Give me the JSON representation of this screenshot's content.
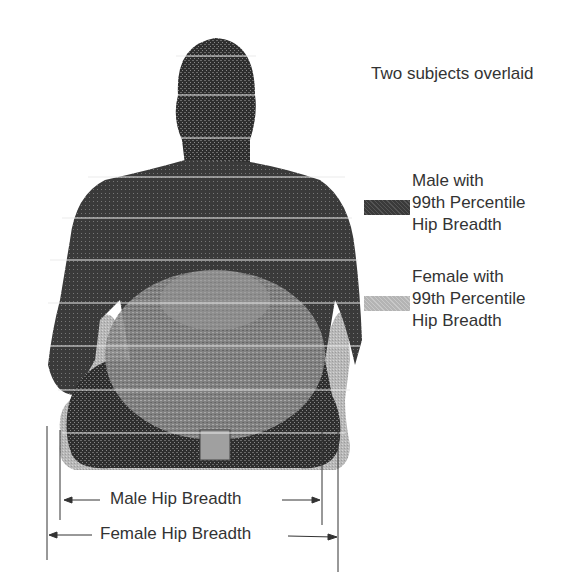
{
  "figure": {
    "title": "Two subjects overlaid",
    "legend": [
      {
        "line1": "Male with",
        "line2": "99th Percentile",
        "line3": "Hip Breadth",
        "swatch_color": "#3a3a3a"
      },
      {
        "line1": "Female with",
        "line2": "99th Percentile",
        "line3": "Hip Breadth",
        "swatch_color": "#b4b4b4"
      }
    ],
    "dimensions": {
      "male_label": "Male Hip Breadth",
      "female_label": "Female Hip Breadth"
    },
    "colors": {
      "male_body": "#2e2e2e",
      "female_body": "#bdbdbd",
      "slice_lines": "#e8e8e8",
      "dimension_lines": "#333333"
    }
  }
}
